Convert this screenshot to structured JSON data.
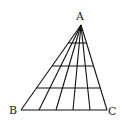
{
  "diagram": {
    "type": "triangle-count-figure",
    "labels": {
      "apex": "A",
      "bottom_left": "B",
      "bottom_right": "C"
    },
    "apex": [
      81,
      25
    ],
    "base_y": 110,
    "base_points_x": [
      21,
      39,
      56,
      73,
      90,
      107
    ],
    "horizontal_lines_y": [
      43,
      66,
      88
    ],
    "stroke_color": "#111111"
  }
}
